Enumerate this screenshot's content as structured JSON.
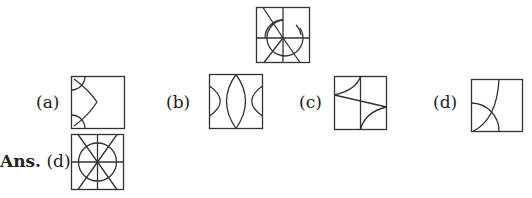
{
  "question_figure": {
    "name": "problem-figure"
  },
  "options": [
    {
      "label": "(a)"
    },
    {
      "label": "(b)"
    },
    {
      "label": "(c)"
    },
    {
      "label": "(d)"
    }
  ],
  "answer": {
    "prefix": "Ans.",
    "choice": "(d)"
  },
  "colors": {
    "stroke": "#333333",
    "background": "#ffffff"
  }
}
